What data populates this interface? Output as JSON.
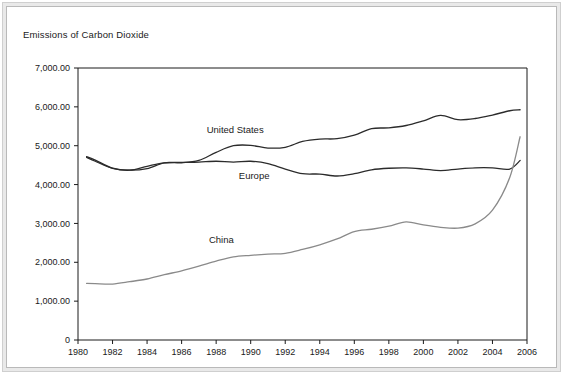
{
  "chart_data": {
    "type": "line",
    "title": "Emissions of Carbon Dioxide",
    "xlabel": "",
    "ylabel": "",
    "xlim": [
      1980,
      2006
    ],
    "ylim": [
      0,
      7000
    ],
    "grid": false,
    "legend_position": "inline-annotation",
    "x_ticks": [
      "1980",
      "1982",
      "1984",
      "1986",
      "1988",
      "1990",
      "1992",
      "1994",
      "1996",
      "1998",
      "2000",
      "2002",
      "2004",
      "2006"
    ],
    "x_tick_values": [
      1980,
      1982,
      1984,
      1986,
      1988,
      1990,
      1992,
      1994,
      1996,
      1998,
      2000,
      2002,
      2004,
      2006
    ],
    "y_ticks": [
      "0",
      "1,000.00",
      "2,000.00",
      "3,000.00",
      "4,000.00",
      "5,000.00",
      "6,000.00",
      "7,000.00"
    ],
    "y_tick_values": [
      0,
      1000,
      2000,
      3000,
      4000,
      5000,
      6000,
      7000
    ],
    "x": [
      1980.5,
      1981,
      1982,
      1983,
      1984,
      1985,
      1986,
      1987,
      1988,
      1989,
      1990,
      1991,
      1992,
      1993,
      1994,
      1995,
      1996,
      1997,
      1998,
      1999,
      2000,
      2001,
      2002,
      2003,
      2004,
      2005,
      2005.6
    ],
    "series": [
      {
        "name": "United States",
        "color": "#2b2b2b",
        "label_x": 1989.1,
        "label_y": 5330,
        "values": [
          4720,
          4630,
          4420,
          4370,
          4410,
          4560,
          4560,
          4620,
          4830,
          5000,
          5010,
          4940,
          4960,
          5110,
          5170,
          5180,
          5270,
          5440,
          5460,
          5520,
          5640,
          5780,
          5670,
          5700,
          5790,
          5900,
          5925
        ]
      },
      {
        "name": "Europe",
        "color": "#2b2b2b",
        "label_x": 1990.2,
        "label_y": 4140,
        "values": [
          4700,
          4600,
          4420,
          4370,
          4470,
          4560,
          4570,
          4580,
          4600,
          4580,
          4600,
          4540,
          4400,
          4280,
          4270,
          4220,
          4280,
          4380,
          4420,
          4430,
          4400,
          4360,
          4400,
          4430,
          4430,
          4400,
          4620
        ]
      },
      {
        "name": "China",
        "color": "#8a8a8a",
        "label_x": 1988.3,
        "label_y": 2490,
        "values": [
          1455,
          1450,
          1440,
          1500,
          1570,
          1680,
          1780,
          1900,
          2030,
          2140,
          2180,
          2210,
          2230,
          2330,
          2450,
          2600,
          2790,
          2850,
          2930,
          3040,
          2960,
          2900,
          2880,
          2990,
          3340,
          4180,
          5230
        ]
      }
    ]
  },
  "plot_geometry": {
    "left": 78,
    "right": 527,
    "top": 68,
    "bottom": 340
  }
}
